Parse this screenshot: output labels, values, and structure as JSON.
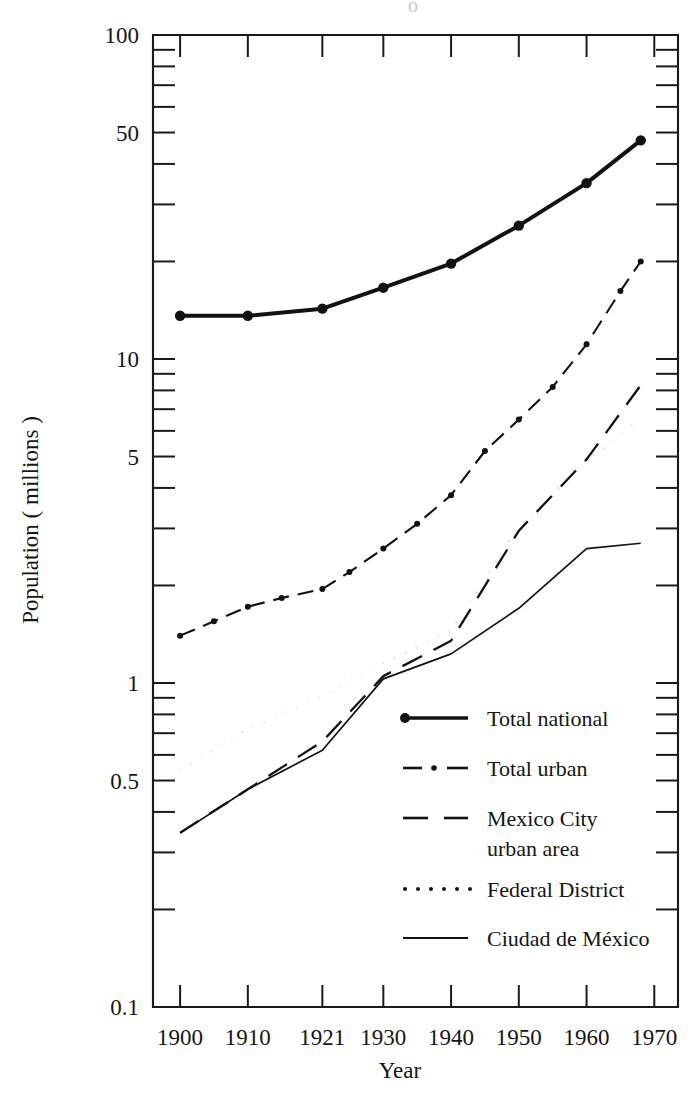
{
  "figure": {
    "background": "#ffffff",
    "ink_color": "#15110f"
  },
  "chart_data": {
    "type": "line",
    "title": "",
    "subtitle": "",
    "xlabel": "Year",
    "ylabel": "Population ( millions )",
    "yscale": "log",
    "ylim": [
      0.1,
      100
    ],
    "grid": false,
    "legend_position": "inside-lower-right",
    "x_tick_labels": [
      "1900",
      "1910",
      "1921",
      "1930",
      "1940",
      "1950",
      "1960",
      "1970"
    ],
    "x_tick_values": [
      1900,
      1910,
      1921,
      1930,
      1940,
      1950,
      1960,
      1970
    ],
    "y_tick_labels": [
      "100",
      "50",
      "10",
      "5",
      "1",
      "0.5",
      "0.1"
    ],
    "y_tick_values": [
      100,
      50,
      10,
      5,
      1,
      0.5,
      0.1
    ],
    "y_minor_ticks": [
      90,
      80,
      70,
      60,
      40,
      30,
      20,
      9,
      8,
      7,
      6,
      4,
      3,
      2,
      0.9,
      0.8,
      0.7,
      0.6,
      0.4,
      0.3,
      0.2
    ],
    "series": [
      {
        "name": "Total national",
        "style": "solid-thick-markers",
        "stroke_width": 4.0,
        "marker": "circle",
        "marker_size": 5.2,
        "x": [
          1900,
          1910,
          1921,
          1930,
          1940,
          1950,
          1960,
          1968
        ],
        "values": [
          13.6,
          13.6,
          14.3,
          16.6,
          19.7,
          25.8,
          34.9,
          47.3
        ]
      },
      {
        "name": "Total urban",
        "style": "dash-dot-markers",
        "stroke_width": 2.1,
        "marker": "circle",
        "marker_size": 3.0,
        "x": [
          1900,
          1905,
          1910,
          1915,
          1921,
          1925,
          1930,
          1935,
          1940,
          1945,
          1950,
          1955,
          1960,
          1965,
          1968
        ],
        "values": [
          1.4,
          1.55,
          1.72,
          1.83,
          1.95,
          2.2,
          2.6,
          3.1,
          3.8,
          5.2,
          6.5,
          8.2,
          11.1,
          16.2,
          20.0
        ]
      },
      {
        "name": "Mexico City urban area",
        "style": "dashed",
        "stroke_width": 2.3,
        "marker": "none",
        "x": [
          1900,
          1910,
          1921,
          1930,
          1940,
          1950,
          1960,
          1968
        ],
        "values": [
          0.345,
          0.47,
          0.66,
          1.05,
          1.35,
          2.95,
          4.9,
          8.3
        ]
      },
      {
        "name": "Federal District",
        "style": "dotted",
        "stroke_width": 3.1,
        "marker": "none",
        "x": [
          1900,
          1910,
          1921,
          1930,
          1940,
          1950,
          1960,
          1968
        ],
        "values": [
          0.54,
          0.72,
          0.91,
          1.15,
          1.45,
          3.05,
          4.85,
          6.55
        ]
      },
      {
        "name": "Ciudad de México",
        "style": "solid-thin",
        "stroke_width": 1.7,
        "marker": "none",
        "x": [
          1900,
          1910,
          1921,
          1930,
          1940,
          1950,
          1960,
          1968
        ],
        "values": [
          0.344,
          0.47,
          0.62,
          1.03,
          1.23,
          1.7,
          2.6,
          2.7
        ]
      }
    ]
  },
  "legend": {
    "entries": [
      {
        "label": "Total national",
        "sample": "solid-thick-dot",
        "label2": ""
      },
      {
        "label": "Total urban",
        "sample": "dash-dot",
        "label2": ""
      },
      {
        "label": "Mexico City",
        "sample": "dashed",
        "label2": "urban area"
      },
      {
        "label": "Federal District",
        "sample": "dotted",
        "label2": ""
      },
      {
        "label": "Ciudad de México",
        "sample": "solid-thin",
        "label2": ""
      }
    ]
  },
  "artifacts": {
    "top_partial_glyph": "o"
  }
}
